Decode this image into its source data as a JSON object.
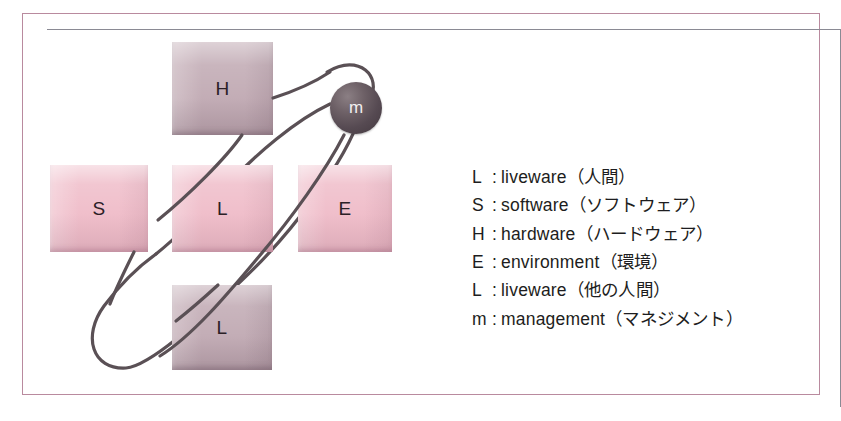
{
  "figure": {
    "frame_border_color": "#b98a9e"
  },
  "diagram": {
    "nodes": [
      {
        "id": "hardware",
        "label": "H",
        "color": "#c3adb6",
        "style": "mauve"
      },
      {
        "id": "software",
        "label": "S",
        "color": "#f0bfcb",
        "style": "pink"
      },
      {
        "id": "liveware-center",
        "label": "L",
        "color": "#f0bfcb",
        "style": "pink"
      },
      {
        "id": "environment",
        "label": "E",
        "color": "#f0bfcb",
        "style": "pink"
      },
      {
        "id": "liveware-other",
        "label": "L",
        "color": "#c3adb6",
        "style": "mauve"
      },
      {
        "id": "management",
        "label": "m",
        "color": "#564a52",
        "style": "sphere"
      }
    ],
    "connector_color": "#5a5055"
  },
  "legend": {
    "items": [
      {
        "key": "L",
        "separator": ":",
        "term": "liveware",
        "japanese": "（人間）"
      },
      {
        "key": "S",
        "separator": ":",
        "term": "software",
        "japanese": "（ソフトウェア）"
      },
      {
        "key": "H",
        "separator": ":",
        "term": "hardware",
        "japanese": "（ハードウェア）"
      },
      {
        "key": "E",
        "separator": ":",
        "term": "environment",
        "japanese": "（環境）"
      },
      {
        "key": "L",
        "separator": ":",
        "term": "liveware",
        "japanese": "（他の人間）"
      },
      {
        "key": "m",
        "separator": ":",
        "term": "management",
        "japanese": "（マネジメント）"
      }
    ]
  }
}
